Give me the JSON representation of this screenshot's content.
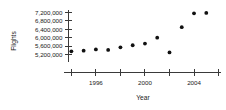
{
  "chart_data": {
    "type": "scatter",
    "title": "",
    "xlabel": "Year",
    "ylabel": "Flights",
    "x": [
      1994,
      1995,
      1996,
      1997,
      1998,
      1999,
      2000,
      2001,
      2002,
      2003,
      2004,
      2005
    ],
    "values": [
      5350000,
      5380000,
      5440000,
      5420000,
      5540000,
      5640000,
      5720000,
      6000000,
      5300000,
      6500000,
      7160000,
      7180000
    ],
    "series": [
      {
        "name": "Flights",
        "values": [
          5350000,
          5380000,
          5440000,
          5420000,
          5540000,
          5640000,
          5720000,
          6000000,
          5300000,
          6500000,
          7160000,
          7180000
        ]
      }
    ],
    "xlim": [
      1993.4,
      2006.2
    ],
    "ylim": [
      5000000,
      7400000
    ],
    "xticks": [
      1994,
      1996,
      1998,
      2000,
      2002,
      2004,
      2006
    ],
    "xticklabels": [
      "",
      "1996",
      "",
      "2000",
      "",
      "2004",
      ""
    ],
    "yticks": [
      5200000,
      5600000,
      6000000,
      6400000,
      6800000,
      7200000
    ],
    "yticklabels": [
      "5,200,000",
      "5,600,000",
      "6,000,000",
      "6,400,000",
      "6,800,000",
      "7,200,000"
    ],
    "grid": false,
    "legend": null,
    "marker": "circle",
    "marker_color": "#111111"
  },
  "axes": {
    "y_title": "Flights",
    "x_title": "Year"
  }
}
